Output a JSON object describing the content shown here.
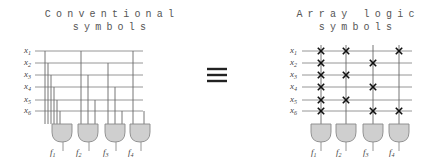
{
  "left_panel": {
    "title_line1": "Conventional",
    "title_line2": "symbols",
    "inputs": [
      "x1",
      "x2",
      "x3",
      "x4",
      "x5",
      "x6"
    ],
    "outputs": [
      "f1",
      "f2",
      "f3",
      "f4"
    ],
    "connections": {
      "f1": [
        "x1",
        "x2",
        "x3",
        "x4",
        "x5",
        "x6"
      ],
      "f2": [
        "x1",
        "x3",
        "x5"
      ],
      "f3": [
        "x2",
        "x4",
        "x6"
      ],
      "f4": [
        "x1",
        "x6"
      ]
    }
  },
  "equivalence_symbol": "≡",
  "right_panel": {
    "title_line1": "Array logic",
    "title_line2": "symbols",
    "inputs": [
      "x1",
      "x2",
      "x3",
      "x4",
      "x5",
      "x6"
    ],
    "outputs": [
      "f1",
      "f2",
      "f3",
      "f4"
    ],
    "crosspoints": {
      "f1": [
        "x1",
        "x2",
        "x3",
        "x4",
        "x5",
        "x6"
      ],
      "f2": [
        "x1",
        "x3",
        "x5"
      ],
      "f3": [
        "x2",
        "x4",
        "x6"
      ],
      "f4": [
        "x1",
        "x6"
      ]
    }
  },
  "colors": {
    "gate_fill": "#cfcfcf",
    "wire": "#8a8a8a",
    "cross": "#111111"
  }
}
